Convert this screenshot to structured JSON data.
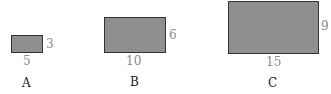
{
  "figure": {
    "shapes": [
      {
        "label": "A",
        "width_label": "5",
        "height_label": "3"
      },
      {
        "label": "B",
        "width_label": "10",
        "height_label": "6"
      },
      {
        "label": "C",
        "width_label": "15",
        "height_label": "9"
      }
    ]
  },
  "colors": {
    "fill": "#8f8f8f",
    "border": "#333333",
    "dim_text": "#8a8a8a",
    "label_text": "#222222"
  }
}
